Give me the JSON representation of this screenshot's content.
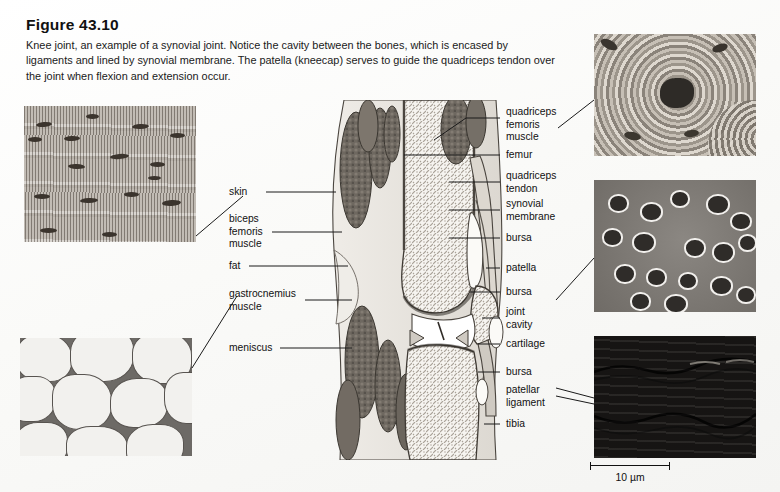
{
  "figure": {
    "title": "Figure 43.10",
    "caption": "Knee joint, an example of a synovial joint. Notice the cavity between the bones, which is encased by ligaments and lined by synovial membrane. The patella (kneecap) serves to guide the quadriceps tendon over the joint when flexion and extension occur."
  },
  "labels_left": [
    {
      "id": "skin",
      "text": "skin"
    },
    {
      "id": "biceps-femoris-muscle",
      "text": "biceps\nfemoris\nmuscle"
    },
    {
      "id": "fat",
      "text": "fat"
    },
    {
      "id": "gastrocnemius-muscle",
      "text": "gastrocnemius\nmuscle"
    },
    {
      "id": "meniscus",
      "text": "meniscus"
    }
  ],
  "labels_right": [
    {
      "id": "quadriceps-femoris-muscle",
      "text": "quadriceps\nfemoris\nmuscle"
    },
    {
      "id": "femur",
      "text": "femur"
    },
    {
      "id": "quadriceps-tendon",
      "text": "quadriceps\ntendon"
    },
    {
      "id": "synovial-membrane",
      "text": "synovial\nmembrane"
    },
    {
      "id": "bursa-upper",
      "text": "bursa"
    },
    {
      "id": "patella",
      "text": "patella"
    },
    {
      "id": "bursa-mid",
      "text": "bursa"
    },
    {
      "id": "joint-cavity",
      "text": "joint\ncavity"
    },
    {
      "id": "cartilage",
      "text": "cartilage"
    },
    {
      "id": "bursa-lower",
      "text": "bursa"
    },
    {
      "id": "patellar-ligament",
      "text": "patellar\nligament"
    },
    {
      "id": "tibia",
      "text": "tibia"
    }
  ],
  "micrographs": [
    {
      "id": "skeletal-muscle",
      "tissue": "skeletal muscle"
    },
    {
      "id": "adipose-tissue",
      "tissue": "adipose tissue"
    },
    {
      "id": "compact-bone",
      "tissue": "compact bone osteon"
    },
    {
      "id": "hyaline-cartilage",
      "tissue": "hyaline cartilage"
    },
    {
      "id": "dense-connective-tissue",
      "tissue": "dense regular connective tissue"
    }
  ],
  "scale_bar": {
    "text": "10 µm"
  },
  "colors": {
    "page_background": "#fbfbfa",
    "text": "#111111",
    "leader_line": "#1a1a1a",
    "bone_fill": "#f4f2ee",
    "muscle_fill": "#6f6a64",
    "cartilage_fill": "#d8d5cf"
  }
}
